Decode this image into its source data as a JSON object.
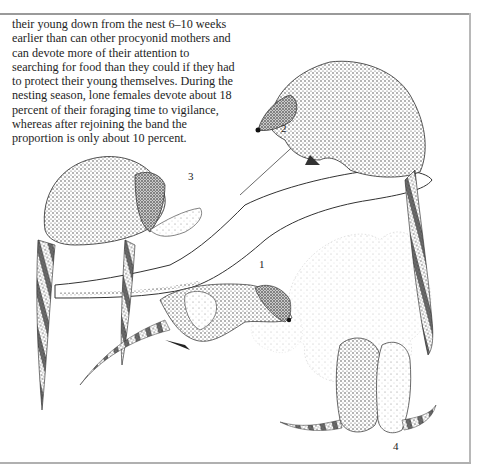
{
  "page": {
    "paragraph_lines": [
      "their young down from the nest 6–10 weeks",
      "earlier than can other procyonid mothers and",
      "can devote more of their attention to",
      "searching for food than they could if they had",
      "to protect their young themselves. During the",
      "nesting season, lone females devote about 18",
      "percent of their foraging time to vigilance,",
      "whereas after rejoining the band the",
      "proportion is only about 10 percent."
    ]
  },
  "figure": {
    "labels": [
      {
        "id": "1",
        "text": "1"
      },
      {
        "id": "2",
        "text": "2"
      },
      {
        "id": "3",
        "text": "3"
      },
      {
        "id": "4",
        "text": "4"
      }
    ],
    "ink_color": "#2a2a2a",
    "rule_color": "#9a9a9a"
  }
}
